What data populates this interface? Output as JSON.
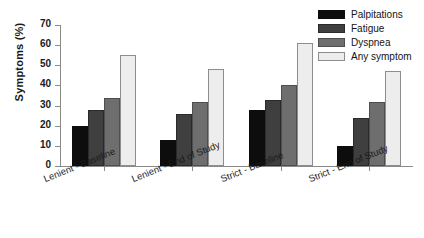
{
  "chart_data": {
    "type": "bar",
    "title": "",
    "xlabel": "",
    "ylabel": "Symptoms (%)",
    "ylim": [
      0,
      70
    ],
    "ytick_values": [
      0,
      10,
      20,
      30,
      40,
      50,
      60,
      70
    ],
    "ytick_labels": [
      "0",
      "10",
      "20",
      "30",
      "40",
      "50",
      "60",
      "70"
    ],
    "grid": false,
    "legend_position": "top-right",
    "categories": [
      "Lenient - Baseline",
      "Lenient - End of Study",
      "Strict - Baseline",
      "Strict - End of Study"
    ],
    "series": [
      {
        "name": "Palpitations",
        "color": "#0d0d0d",
        "values": [
          20,
          13,
          28,
          10
        ]
      },
      {
        "name": "Fatigue",
        "color": "#3f3f3f",
        "values": [
          28,
          26,
          33,
          24
        ]
      },
      {
        "name": "Dyspnea",
        "color": "#6e6e6e",
        "values": [
          34,
          32,
          40,
          32
        ]
      },
      {
        "name": "Any symptom",
        "color": "#ededed",
        "values": [
          55,
          48,
          61,
          47
        ]
      }
    ]
  }
}
